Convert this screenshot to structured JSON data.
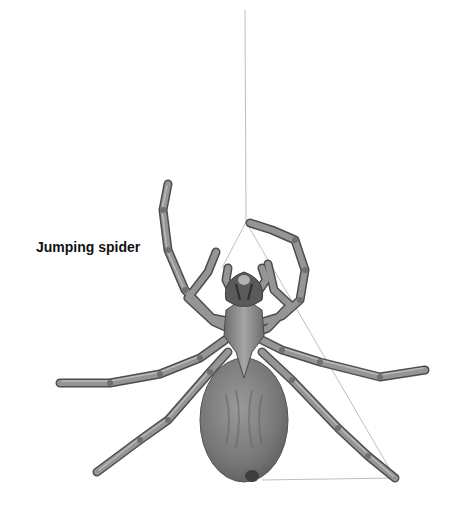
{
  "illustration": {
    "label": "Jumping spider",
    "subject": "spider-icon",
    "colors": {
      "body": "#7f7f7f",
      "body_dark": "#5a5a5a",
      "leg": "#8a8a8a",
      "leg_outline": "#4a4a4a",
      "silk": "#b5b5b5",
      "label": "#111111",
      "background": "#ffffff"
    }
  }
}
